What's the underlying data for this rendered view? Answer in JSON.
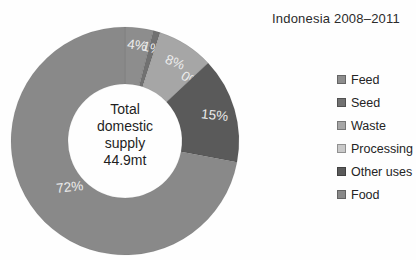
{
  "title": "Indonesia 2008–2011",
  "center_label": {
    "line1": "Total",
    "line2": "domestic",
    "line3": "supply",
    "line4": "44.9mt"
  },
  "chart_data": {
    "type": "pie",
    "subtype": "donut",
    "title": "Indonesia 2008–2011",
    "center_text": "Total domestic supply 44.9mt",
    "total_value": "44.9mt",
    "categories": [
      "Feed",
      "Seed",
      "Waste",
      "Processing",
      "Other uses",
      "Food"
    ],
    "values": [
      4,
      1,
      8,
      0,
      15,
      72
    ],
    "unit": "%",
    "slice_labels": [
      "4%",
      "1%",
      "8%",
      "0%",
      "15%",
      "72%"
    ],
    "colors": [
      "#8d8d8d",
      "#717171",
      "#a6a6a6",
      "#c9c9c9",
      "#5a5a5a",
      "#898989"
    ],
    "start_angle_deg": 0,
    "direction": "clockwise",
    "legend_position": "right"
  }
}
